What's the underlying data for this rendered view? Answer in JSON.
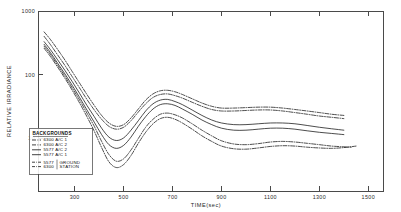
{
  "chart_data": {
    "type": "line",
    "title": "",
    "xlabel": "TIME(sec)",
    "ylabel": "RELATIVE IRRADIANCE",
    "xlim": [
      150,
      1560
    ],
    "ylim": [
      1.5,
      1000
    ],
    "yscale": "log",
    "xscale": "linear",
    "grid": false,
    "legend_position": "lower-left",
    "legend_title": "BACKGROUNDS",
    "xticks": [
      300,
      500,
      700,
      900,
      1100,
      1300,
      1500
    ],
    "xtick_labels": [
      "300",
      "500",
      "700",
      "900",
      "1100",
      "1300",
      "1500"
    ],
    "yticks": [
      10,
      100,
      1000
    ],
    "ytick_labels": [
      "10",
      "100",
      "1000"
    ],
    "series": [
      {
        "name": "6300 A/C 1",
        "style": "dash-dot",
        "x": [
          175,
          200,
          230,
          260,
          290,
          320,
          350,
          380,
          410,
          440,
          470,
          500,
          530,
          560,
          590,
          620,
          650,
          680,
          710,
          740,
          780,
          820,
          860,
          900,
          950,
          1000,
          1050,
          1100,
          1150,
          1200,
          1250,
          1300,
          1350,
          1400
        ],
        "y": [
          470,
          360,
          250,
          170,
          112,
          74,
          49,
          33,
          23,
          17.5,
          15.5,
          16.5,
          21,
          29,
          40,
          50,
          56,
          57,
          54,
          49,
          42,
          36,
          32,
          30,
          30,
          30.5,
          31,
          31,
          30,
          28.5,
          27,
          25.5,
          24,
          23
        ]
      },
      {
        "name": "6300 A/C 2",
        "style": "dash-dot",
        "x": [
          175,
          200,
          230,
          260,
          290,
          320,
          350,
          380,
          410,
          440,
          470,
          500,
          530,
          560,
          590,
          620,
          650,
          680,
          710,
          740,
          780,
          820,
          860,
          900,
          950,
          1000,
          1050,
          1100,
          1150,
          1200,
          1250,
          1300,
          1350,
          1400
        ],
        "y": [
          400,
          300,
          205,
          140,
          93,
          62,
          41,
          28,
          20,
          15.5,
          14,
          15,
          19,
          26,
          35,
          44,
          49,
          50,
          47,
          43,
          37,
          32,
          28.5,
          27,
          27,
          27.5,
          28,
          28,
          27,
          25.5,
          24,
          22.5,
          21.5,
          20.5
        ]
      },
      {
        "name": "5577 A/C 2",
        "style": "solid",
        "x": [
          175,
          200,
          230,
          260,
          290,
          320,
          350,
          380,
          410,
          440,
          470,
          500,
          530,
          560,
          590,
          620,
          650,
          680,
          710,
          740,
          780,
          820,
          860,
          900,
          950,
          1000,
          1050,
          1100,
          1150,
          1200,
          1250,
          1300,
          1350,
          1400
        ],
        "y": [
          330,
          250,
          172,
          117,
          78,
          51,
          33,
          22,
          14.5,
          10.5,
          9.3,
          10.2,
          13.5,
          19,
          27,
          35,
          40,
          41,
          38,
          34,
          28,
          23,
          19.5,
          17.5,
          16.5,
          16.5,
          17,
          17.5,
          17.5,
          17,
          16,
          15,
          14.2,
          13.5
        ]
      },
      {
        "name": "5577 A/C 1",
        "style": "solid",
        "x": [
          175,
          200,
          230,
          260,
          290,
          320,
          350,
          380,
          410,
          440,
          470,
          500,
          530,
          560,
          590,
          620,
          650,
          680,
          710,
          740,
          780,
          820,
          860,
          900,
          950,
          1000,
          1050,
          1100,
          1150,
          1200,
          1250,
          1300,
          1350,
          1400
        ],
        "y": [
          300,
          225,
          152,
          103,
          68,
          44,
          28,
          18,
          11.5,
          8.0,
          7.0,
          7.8,
          10.5,
          15.5,
          22,
          29,
          34,
          35,
          33,
          29,
          24,
          19.5,
          16.5,
          14.5,
          13.5,
          13.5,
          14,
          14.5,
          14.5,
          14,
          13.2,
          12.5,
          12,
          11.5
        ]
      },
      {
        "name": "5577 GROUND STATION",
        "style": "dash-dot",
        "x": [
          175,
          200,
          230,
          260,
          290,
          320,
          350,
          380,
          410,
          440,
          470,
          500,
          530,
          560,
          590,
          620,
          650,
          680,
          710,
          740,
          780,
          820,
          860,
          900,
          950,
          1000,
          1050,
          1100,
          1150,
          1200,
          1250,
          1300,
          1350,
          1400,
          1430
        ],
        "y": [
          280,
          210,
          142,
          95,
          62,
          40,
          25,
          15.5,
          9.0,
          5.6,
          4.4,
          4.8,
          6.6,
          10.0,
          15.0,
          20,
          24,
          25,
          23.5,
          21,
          17,
          13.5,
          11,
          9.2,
          8.2,
          8.0,
          8.3,
          8.8,
          9.0,
          8.8,
          8.4,
          8.0,
          7.6,
          7.4,
          7.3
        ]
      },
      {
        "name": "6300 GROUND STATION",
        "style": "dash-dot",
        "x": [
          175,
          200,
          230,
          260,
          290,
          320,
          350,
          380,
          410,
          440,
          470,
          500,
          530,
          560,
          590,
          620,
          650,
          680,
          710,
          740,
          780,
          820,
          860,
          900,
          950,
          1000,
          1050,
          1100,
          1150,
          1200,
          1250,
          1300,
          1350,
          1400,
          1450
        ],
        "y": [
          260,
          195,
          132,
          88,
          57,
          36,
          22,
          13.0,
          7.2,
          4.3,
          3.5,
          3.9,
          5.4,
          8.4,
          12.5,
          17,
          20.5,
          21.5,
          20,
          17.5,
          14,
          11,
          9.0,
          7.6,
          6.9,
          6.8,
          7.1,
          7.5,
          7.7,
          7.6,
          7.3,
          7.1,
          7.0,
          7.2,
          7.6
        ]
      }
    ]
  },
  "axes": {
    "y_label": "RELATIVE IRRADIANCE",
    "x_label": "TIME(sec)",
    "y_ticks": [
      {
        "label": "1000",
        "value": 1000
      },
      {
        "label": "100",
        "value": 100
      },
      {
        "label": "10",
        "value": 10
      }
    ],
    "x_ticks": [
      {
        "label": "300",
        "value": 300
      },
      {
        "label": "500",
        "value": 500
      },
      {
        "label": "700",
        "value": 700
      },
      {
        "label": "900",
        "value": 900
      },
      {
        "label": "1100",
        "value": 1100
      },
      {
        "label": "1300",
        "value": 1300
      },
      {
        "label": "1500",
        "value": 1500
      }
    ]
  },
  "legend": {
    "title": "BACKGROUNDS",
    "aircraft_entries": [
      {
        "label": "6300 A/C 1"
      },
      {
        "label": "6300 A/C 2"
      },
      {
        "label": "5577 A/C 2"
      },
      {
        "label": "5577 A/C 1"
      }
    ],
    "ground_entries": [
      {
        "code": "5577",
        "group": "GROUND"
      },
      {
        "code": "6300",
        "group": "STATION"
      }
    ]
  },
  "colors": {
    "curve": "#111111",
    "frame": "#4a4a4a",
    "text": "#1a1a1a",
    "background": "#ffffff"
  }
}
